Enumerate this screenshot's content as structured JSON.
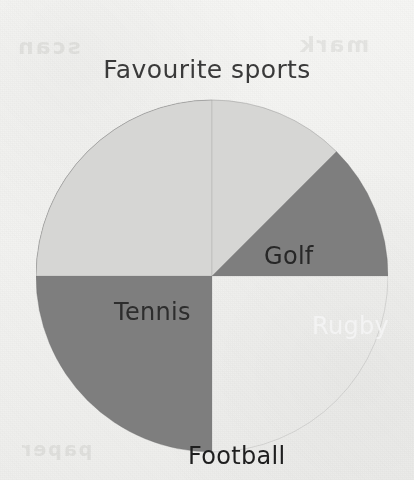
{
  "chart_data": {
    "type": "pie",
    "title": "Favourite sports",
    "categories": [
      "Football",
      "Tennis",
      "Golf",
      "Rugby"
    ],
    "values": [
      50,
      25,
      12.5,
      12.5
    ],
    "units": "percent",
    "legend": "none",
    "labels_inside": true,
    "slices": [
      {
        "name": "Football",
        "label": "Football",
        "value": 50,
        "start_angle": 180,
        "end_angle": 360,
        "sweep": 180,
        "color": "#7e7e7e",
        "label_color": "#1f1f1f"
      },
      {
        "name": "Tennis",
        "label": "Tennis",
        "value": 25,
        "start_angle": 270,
        "end_angle": 360,
        "sweep": 90,
        "color": "#d6d6d4",
        "label_color": "#2d2d2d"
      },
      {
        "name": "Golf",
        "label": "Golf",
        "value": 12.5,
        "start_angle": 0,
        "end_angle": 45,
        "sweep": 45,
        "color": "#d6d6d4",
        "label_color": "#272727"
      },
      {
        "name": "Rugby",
        "label": "Rugby",
        "value": 12.5,
        "start_angle": 45,
        "end_angle": 90,
        "sweep": 45,
        "color": "#7e7e7e",
        "label_color": "#f3f3f3"
      }
    ],
    "xlabel": "",
    "ylabel": ""
  },
  "page": {
    "background_color": "#f2f2f0",
    "ghost_text_top_left": "scan",
    "ghost_text_top_right": "mark",
    "ghost_text_bottom": "paper"
  }
}
